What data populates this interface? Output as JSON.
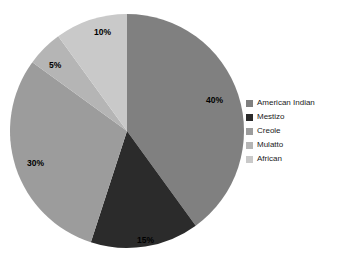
{
  "chart_data": {
    "type": "pie",
    "title": "",
    "subtitle": "",
    "xlabel": "",
    "ylabel": "",
    "legend_position": "right",
    "grid": false,
    "start_angle_deg": 0,
    "direction": "clockwise",
    "categories": [
      "American Indian",
      "Mestizo",
      "Creole",
      "Mulatto",
      "African"
    ],
    "values": [
      40,
      15,
      30,
      5,
      10
    ],
    "value_unit": "%",
    "slices": [
      {
        "label": "American Indian",
        "value": 40,
        "data_label": "40%",
        "color": "#808080",
        "label_x": 206,
        "label_y": 96
      },
      {
        "label": "Mestizo",
        "value": 15,
        "data_label": "15%",
        "color": "#2b2b2b",
        "label_x": 137,
        "label_y": 236
      },
      {
        "label": "Creole",
        "value": 30,
        "data_label": "30%",
        "color": "#9c9c9c",
        "label_x": 27,
        "label_y": 159
      },
      {
        "label": "Mulatto",
        "value": 5,
        "data_label": "5%",
        "color": "#b5b5b5",
        "label_x": 49,
        "label_y": 61
      },
      {
        "label": "African",
        "value": 10,
        "data_label": "10%",
        "color": "#c9c9c9",
        "label_x": 94,
        "label_y": 28
      }
    ]
  },
  "legend": {
    "items": [
      {
        "label": "American Indian",
        "color": "#808080"
      },
      {
        "label": "Mestizo",
        "color": "#2b2b2b"
      },
      {
        "label": "Creole",
        "color": "#9c9c9c"
      },
      {
        "label": "Mulatto",
        "color": "#b5b5b5"
      },
      {
        "label": "African",
        "color": "#c9c9c9"
      }
    ]
  },
  "geometry": {
    "center_x": 127,
    "center_y": 131,
    "radius": 117
  }
}
